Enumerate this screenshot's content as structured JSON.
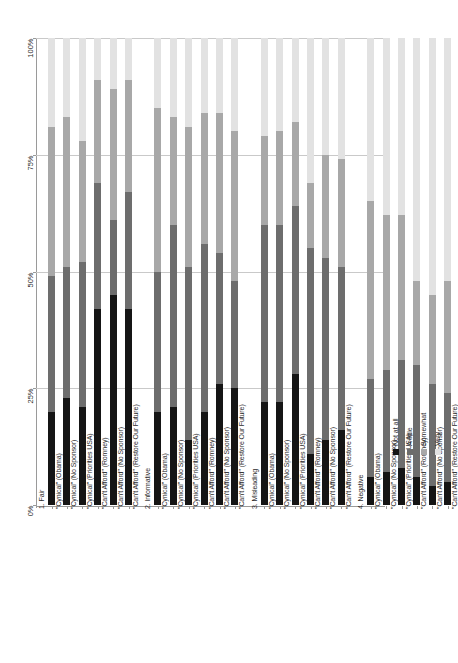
{
  "chart_data": {
    "type": "bar",
    "subtype": "100% stacked column",
    "title": "",
    "xlabel": "",
    "ylabel": "",
    "ylim": [
      0,
      100
    ],
    "ytick_labels": [
      "0%",
      "25%",
      "50%",
      "75%",
      "100%"
    ],
    "ytick_values": [
      0,
      25,
      50,
      75,
      100
    ],
    "grid": true,
    "legend_position": "bottom-right",
    "legend_orientation": "vertical-rotated",
    "series": [
      {
        "name": "Not at all",
        "color": "#151515"
      },
      {
        "name": "A little",
        "color": "#6d6d6d"
      },
      {
        "name": "Somewhat",
        "color": "#a8a8a8"
      },
      {
        "name": "Very",
        "color": "#e2e2e2"
      }
    ],
    "groups": [
      {
        "group_label": "1. Fair",
        "categories": [
          "\"Cynical\" (Obama)",
          "\"Cynical\" (No Sponsor)",
          "\"Cynical\" (Priorities USA)",
          "\"Can't Afford\" (Romney)",
          "\"Can't Afford\" (No Sponsor)",
          "\"Can't Afford\" (Restore Our Future)"
        ],
        "values": {
          "Not at all": [
            20,
            23,
            21,
            42,
            45,
            42
          ],
          "A little": [
            29,
            28,
            31,
            27,
            16,
            25
          ],
          "Somewhat": [
            32,
            32,
            26,
            22,
            28,
            24
          ],
          "Very": [
            19,
            17,
            22,
            9,
            11,
            9
          ]
        }
      },
      {
        "group_label": "2. Informative",
        "categories": [
          "\"Cynical\" (Obama)",
          "\"Cynical\" (No Sponsor)",
          "\"Cynical\" (Priorities USA)",
          "\"Can't Afford\" (Romney)",
          "\"Can't Afford\" (No Sponsor)",
          "\"Can't Afford\" (Restore Our Future)"
        ],
        "values": {
          "Not at all": [
            20,
            21,
            14,
            20,
            26,
            25
          ],
          "A little": [
            30,
            39,
            37,
            36,
            28,
            23
          ],
          "Somewhat": [
            35,
            23,
            30,
            28,
            30,
            32
          ],
          "Very": [
            15,
            17,
            19,
            16,
            16,
            20
          ]
        }
      },
      {
        "group_label": "3. Misleading",
        "categories": [
          "\"Cynical\" (Obama)",
          "\"Cynical\" (No Sponsor)",
          "\"Cynical\" (Priorities USA)",
          "\"Can't Afford\" (Romney)",
          "\"Can't Afford\" (No Sponsor)",
          "\"Can't Afford\" (Restore Our Future)"
        ],
        "values": {
          "Not at all": [
            22,
            22,
            28,
            11,
            14,
            16
          ],
          "A little": [
            38,
            38,
            36,
            44,
            39,
            35
          ],
          "Somewhat": [
            19,
            20,
            18,
            14,
            22,
            23
          ],
          "Very": [
            21,
            20,
            18,
            31,
            25,
            26
          ]
        }
      },
      {
        "group_label": "4. Negative",
        "categories": [
          "\"Cynical\" (Obama)",
          "\"Cynical\" (No Sponsor)",
          "\"Cynical\" (Priorities USA)",
          "\"Can't Afford\" (Romney)",
          "\"Can't Afford\" (No Sponsor)",
          "\"Can't Afford\" (Restore Our Future)"
        ],
        "values": {
          "Not at all": [
            6,
            7,
            8,
            6,
            4,
            5
          ],
          "A little": [
            21,
            22,
            23,
            24,
            22,
            19
          ],
          "Somewhat": [
            38,
            33,
            31,
            18,
            19,
            24
          ],
          "Very": [
            35,
            38,
            38,
            52,
            55,
            52
          ]
        }
      }
    ]
  }
}
